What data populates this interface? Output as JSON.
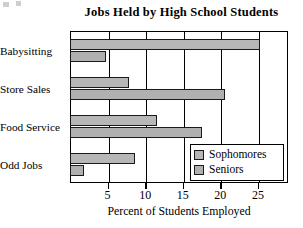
{
  "chart": {
    "title": "Jobs Held by High School Students",
    "xlabel": "Percent of Students Employed",
    "ylabel": ""
  },
  "legend": {
    "position": "inside-bottom-right",
    "entries": [
      {
        "label": "Sophomores",
        "color": "#b7b7b7"
      },
      {
        "label": "Seniors",
        "color": "#b0b0b0"
      }
    ]
  },
  "axis": {
    "ticks": [
      {
        "value": 5,
        "label": "5"
      },
      {
        "value": 10,
        "label": "10"
      },
      {
        "value": 15,
        "label": "15"
      },
      {
        "value": 20,
        "label": "20"
      },
      {
        "value": 25,
        "label": "25"
      }
    ]
  },
  "chart_data": {
    "type": "bar",
    "orientation": "horizontal",
    "title": "Jobs Held by High School Students",
    "xlabel": "Percent of Students Employed",
    "ylabel": "",
    "categories": [
      "Babysitting",
      "Store Sales",
      "Food Service",
      "Odd Jobs"
    ],
    "series": [
      {
        "name": "Sophomores",
        "color": "#b7b7b7",
        "values": [
          25.3,
          7.8,
          11.6,
          8.6
        ]
      },
      {
        "name": "Seniors",
        "color": "#b0b0b0",
        "values": [
          4.8,
          20.6,
          17.5,
          1.9
        ]
      }
    ],
    "xlim": [
      0,
      29
    ],
    "ylim": null,
    "grid": true,
    "grid_axis": "x",
    "legend": "inside-bottom-right",
    "legend_entries": [
      "Sophomores",
      "Seniors"
    ],
    "xticks": [
      5,
      10,
      15,
      20,
      25
    ],
    "bar_style": {
      "fill": "#b7b7b7",
      "edge": "#1a1a1a"
    },
    "background": "#ffffff"
  }
}
